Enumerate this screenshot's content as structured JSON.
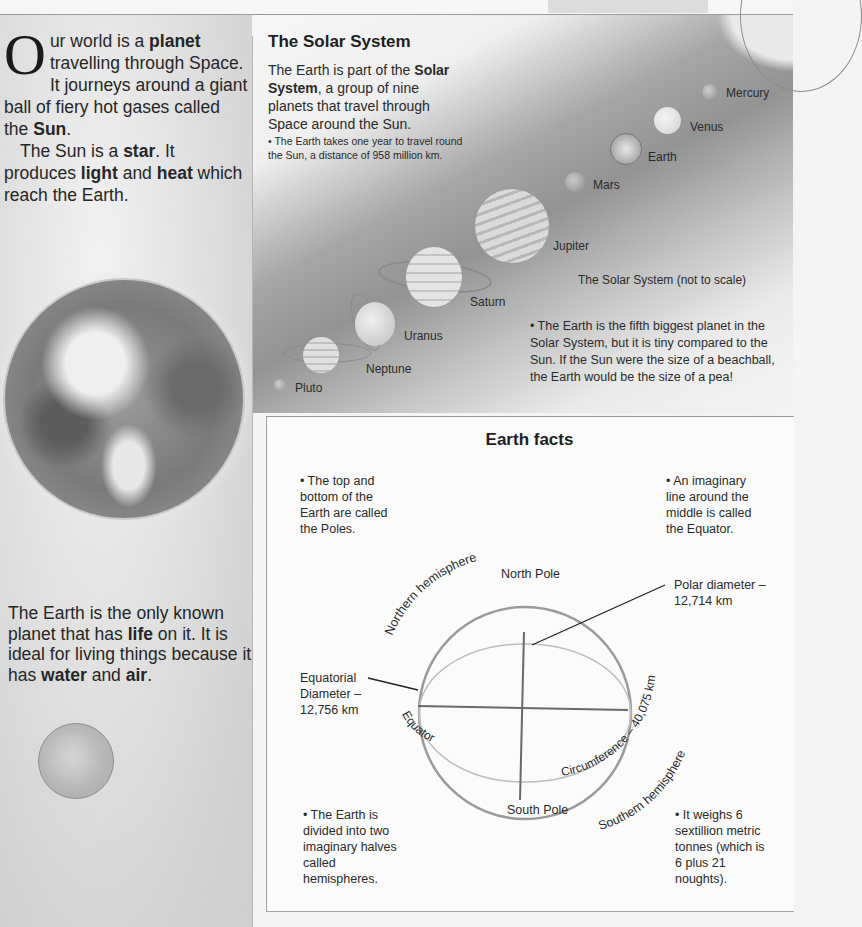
{
  "intro": {
    "dropcap": "O",
    "line1_pre": "ur world is a ",
    "line1_bold": "planet",
    "line2": "travelling through Space. It journeys around a giant ball of fiery hot gases called the ",
    "sun_bold": "Sun",
    "end1": ".",
    "p2_pre": "The Sun is a ",
    "star_bold": "star",
    "p2_mid": ". It produces ",
    "light_bold": "light",
    "and": " and ",
    "heat_bold": "heat",
    "p2_end": " which reach the Earth."
  },
  "life": {
    "pre": "The Earth is the only known planet that has ",
    "life_bold": "life",
    "mid": " on it. It is ideal for living things because it has ",
    "water_bold": "water",
    "and": " and ",
    "air_bold": "air",
    "end": "."
  },
  "solar": {
    "title": "The Solar System",
    "intro_pre": "The Earth is part of the ",
    "intro_bold": "Solar System",
    "intro_post": ", a group of nine planets that travel through Space around the Sun.",
    "bullet1": "• The Earth takes one year to travel round the Sun, a distance of 958 million km.",
    "scale_note": "The Solar System (not to scale)",
    "bullet2": "• The Earth is the fifth biggest planet in the Solar System, but it is tiny compared to the Sun. If the Sun were the size of a beachball, the Earth would be the size of a pea!",
    "planets": [
      {
        "name": "Mercury"
      },
      {
        "name": "Venus"
      },
      {
        "name": "Earth"
      },
      {
        "name": "Mars"
      },
      {
        "name": "Jupiter"
      },
      {
        "name": "Saturn"
      },
      {
        "name": "Uranus"
      },
      {
        "name": "Neptune"
      },
      {
        "name": "Pluto"
      }
    ]
  },
  "facts": {
    "title": "Earth facts",
    "poles": "• The top and bottom of the Earth are called the Poles.",
    "equator": "• An imaginary line around the middle is called the Equator.",
    "hemispheres": "• The Earth is divided into two imaginary halves called hemispheres.",
    "weight": "• It weighs 6 sextillion metric tonnes (which is 6 plus 21 noughts).",
    "diagram": {
      "north_pole": "North Pole",
      "south_pole": "South Pole",
      "northern_hemisphere": "Northern hemisphere",
      "southern_hemisphere": "Southern hemisphere",
      "equator": "Equator",
      "circumference": "Circumference – 40,075 km",
      "polar_diameter_1": "Polar diameter –",
      "polar_diameter_2": "12,714 km",
      "equatorial_1": "Equatorial",
      "equatorial_2": "Diameter –",
      "equatorial_3": "12,756 km"
    }
  }
}
